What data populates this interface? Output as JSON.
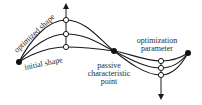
{
  "diagram": {
    "type": "shape-optimization-schematic",
    "colors": {
      "line": "#1a1a1a",
      "text": "#2a2a2a",
      "background": "#ffffff"
    },
    "labels": {
      "optimized_shape": "optimized shape",
      "initial_shape": "initial shape",
      "passive_line1": "passive",
      "passive_line2": "characteristic",
      "passive_line3": "point",
      "param_line1": "optimization",
      "param_line2": "parameter"
    },
    "nodes": {
      "left_end": {
        "x": 19,
        "y": 62,
        "kind": "filled"
      },
      "passive_point": {
        "x": 114,
        "y": 51,
        "kind": "filled"
      },
      "right_end": {
        "x": 188,
        "y": 53,
        "kind": "filled"
      },
      "upper_control_points": [
        {
          "x": 66,
          "y": 20,
          "kind": "open"
        },
        {
          "x": 66,
          "y": 34,
          "kind": "open"
        },
        {
          "x": 66,
          "y": 47,
          "kind": "open"
        }
      ],
      "lower_control_points": [
        {
          "x": 161,
          "y": 61,
          "kind": "open"
        },
        {
          "x": 161,
          "y": 68,
          "kind": "open"
        },
        {
          "x": 161,
          "y": 75,
          "kind": "open"
        }
      ]
    },
    "arrows": [
      {
        "name": "upward-parameter-arrow",
        "x": 66,
        "from_y": 47,
        "to_y": 5
      },
      {
        "name": "downward-parameter-arrow",
        "x": 161,
        "from_y": 61,
        "to_y": 98
      }
    ],
    "curves": [
      {
        "name": "optimized-shape-curve",
        "peak_y": 20,
        "trough_y": 75
      },
      {
        "name": "intermediate-shape-curve",
        "peak_y": 34,
        "trough_y": 68
      },
      {
        "name": "initial-shape-curve",
        "peak_y": 47,
        "trough_y": 61
      }
    ]
  }
}
